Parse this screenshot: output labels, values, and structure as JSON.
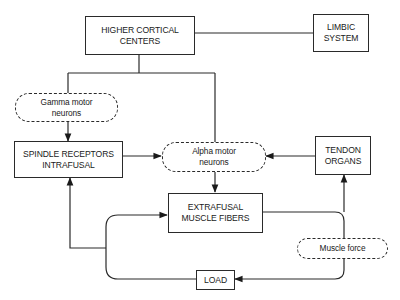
{
  "diagram": {
    "type": "flowchart",
    "nodes": {
      "higher_cortical": {
        "label": "HIGHER CORTICAL\nCENTERS",
        "shape": "rect"
      },
      "limbic": {
        "label": "LIMBIC\nSYSTEM",
        "shape": "rect"
      },
      "gamma": {
        "label": "Gamma motor\nneurons",
        "shape": "dashed-rounded"
      },
      "spindle": {
        "label": "SPINDLE RECEPTORS\nINTRAFUSAL",
        "shape": "rect"
      },
      "alpha": {
        "label": "Alpha motor\nneurons",
        "shape": "dashed-rounded"
      },
      "tendon": {
        "label": "TENDON\nORGANS",
        "shape": "rect"
      },
      "extrafusal": {
        "label": "EXTRAFUSAL\nMUSCLE FIBERS",
        "shape": "rect"
      },
      "muscle_force": {
        "label": "Muscle force",
        "shape": "dashed-rounded"
      },
      "load": {
        "label": "LOAD",
        "shape": "rect"
      }
    },
    "edges": [
      {
        "from": "higher_cortical",
        "to": "limbic",
        "arrow": false
      },
      {
        "from": "higher_cortical",
        "to": "gamma",
        "arrow": false
      },
      {
        "from": "higher_cortical",
        "to": "alpha",
        "arrow": false
      },
      {
        "from": "gamma",
        "to": "spindle",
        "arrow": true
      },
      {
        "from": "spindle",
        "to": "alpha",
        "arrow": true
      },
      {
        "from": "tendon",
        "to": "alpha",
        "arrow": true
      },
      {
        "from": "alpha",
        "to": "extrafusal",
        "arrow": true
      },
      {
        "from": "extrafusal",
        "to": "muscle_force",
        "arrow": false
      },
      {
        "from": "muscle_force",
        "to": "tendon",
        "arrow": true
      },
      {
        "from": "muscle_force",
        "to": "load",
        "arrow": true
      },
      {
        "from": "load",
        "to": "extrafusal",
        "arrow": true
      },
      {
        "from": "load",
        "to": "spindle",
        "arrow": true
      }
    ],
    "line_color": "#2a2a2a",
    "background": "#ffffff"
  }
}
